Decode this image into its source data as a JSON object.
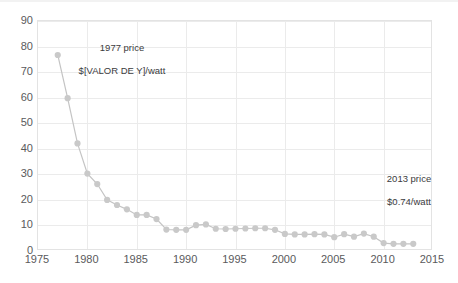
{
  "chart_data": {
    "type": "line",
    "title": "",
    "subtitle": "",
    "xlabel": "",
    "ylabel": "",
    "xlim": [
      1975,
      2015
    ],
    "ylim": [
      0,
      90
    ],
    "grid": true,
    "legend": "none",
    "marker": "circle",
    "series_color": "#c9c9c9",
    "line_color": "#c4c4c4",
    "grid_color": "#ebebeb",
    "axis_text_color": "#5a5a5c",
    "xticks": [
      "1975",
      "1980",
      "1985",
      "1990",
      "1995",
      "2000",
      "2005",
      "2010",
      "2015"
    ],
    "xtick_values": [
      1975,
      1980,
      1985,
      1990,
      1995,
      2000,
      2005,
      2010,
      2015
    ],
    "yticks": [
      "0",
      "10",
      "20",
      "30",
      "40",
      "50",
      "60",
      "70",
      "80",
      "90"
    ],
    "ytick_values": [
      0,
      10,
      20,
      30,
      40,
      50,
      60,
      70,
      80,
      90
    ],
    "x": [
      1977,
      1978,
      1979,
      1980,
      1981,
      1982,
      1983,
      1984,
      1985,
      1986,
      1987,
      1988,
      1989,
      1990,
      1991,
      1992,
      1993,
      1994,
      1995,
      1996,
      1997,
      1998,
      1999,
      2000,
      2001,
      2002,
      2003,
      2004,
      2005,
      2006,
      2007,
      2008,
      2009,
      2010,
      2011,
      2012,
      2013
    ],
    "values": [
      76.7,
      59.8,
      42.1,
      30.3,
      26.2,
      20.0,
      18.0,
      16.3,
      14.1,
      14.1,
      12.5,
      8.4,
      8.3,
      8.3,
      10.1,
      10.4,
      8.7,
      8.6,
      8.7,
      8.8,
      8.9,
      8.9,
      8.3,
      6.7,
      6.5,
      6.5,
      6.6,
      6.5,
      5.4,
      6.6,
      5.6,
      6.8,
      5.6,
      3.1,
      2.8,
      2.8,
      2.8
    ],
    "point_count": 37,
    "annotations": [
      {
        "id": "annotation-1977",
        "text": "1977 price\n$[VALOR DE Y]/watt",
        "line1": "1977 price",
        "line2": "$[VALOR DE Y]/watt",
        "anchor_year": 1977,
        "anchor_value": 76.7
      },
      {
        "id": "annotation-2013",
        "text": "2013 price\n$0.74/watt",
        "line1": "2013 price",
        "line2": "$0.74/watt",
        "anchor_year": 2013,
        "anchor_value": 0.74
      }
    ]
  }
}
